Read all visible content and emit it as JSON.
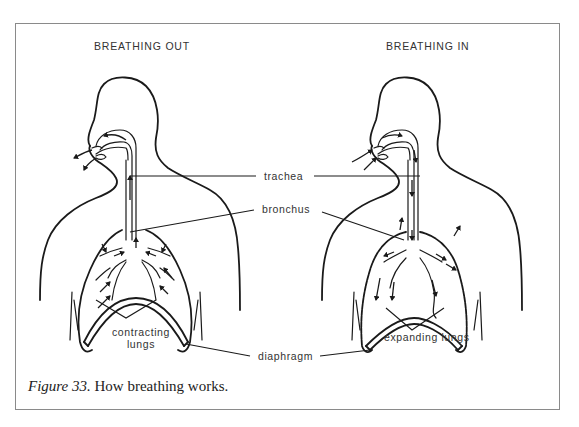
{
  "figure": {
    "panels": [
      {
        "title": "BREATHING OUT",
        "lung_label": "contracting lungs",
        "lung_label_line1": "contracting",
        "lung_label_line2": "lungs",
        "airflow": "out"
      },
      {
        "title": "BREATHING IN",
        "lung_label": "expanding lungs",
        "airflow": "in"
      }
    ],
    "labels": {
      "trachea": "trachea",
      "bronchus": "bronchus",
      "diaphragm": "diaphragm"
    },
    "caption": {
      "prefix": "Figure 33.",
      "text": " How breathing works."
    },
    "colors": {
      "line": "#1a1a1a",
      "frame": "#8a8a8a",
      "background": "#ffffff"
    }
  }
}
